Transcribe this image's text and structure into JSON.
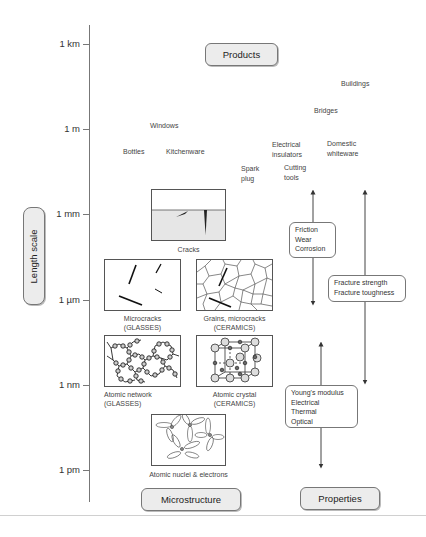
{
  "axis": {
    "title": "Length scale",
    "ticks": [
      {
        "label": "1 km",
        "y": 44
      },
      {
        "label": "1 m",
        "y": 129
      },
      {
        "label": "1 mm",
        "y": 214
      },
      {
        "label": "1 µm",
        "y": 300
      },
      {
        "label": "1 nm",
        "y": 385
      },
      {
        "label": "1 pm",
        "y": 470
      }
    ]
  },
  "headers": {
    "products": "Products",
    "microstructure": "Microstructure",
    "properties": "Properties"
  },
  "products": [
    {
      "label": "Buildings",
      "x": 341,
      "y": 80
    },
    {
      "label": "Bridges",
      "x": 314,
      "y": 107
    },
    {
      "label": "Windows",
      "x": 150,
      "y": 122
    },
    {
      "label": "Electrical",
      "x": 272,
      "y": 141
    },
    {
      "label": "insulators",
      "x": 272,
      "y": 151
    },
    {
      "label": "Domestic",
      "x": 327,
      "y": 140
    },
    {
      "label": "whiteware",
      "x": 327,
      "y": 150
    },
    {
      "label": "Bottles",
      "x": 123,
      "y": 148
    },
    {
      "label": "Kitchenware",
      "x": 166,
      "y": 148
    },
    {
      "label": "Spark",
      "x": 241,
      "y": 165
    },
    {
      "label": "plug",
      "x": 241,
      "y": 175
    },
    {
      "label": "Cutting",
      "x": 284,
      "y": 164
    },
    {
      "label": "tools",
      "x": 284,
      "y": 174
    }
  ],
  "microstructure": {
    "cracks": {
      "caption": "Cracks"
    },
    "microcracks": {
      "caption_line1": "Microcracks",
      "caption_line2": "(GLASSES)"
    },
    "grains": {
      "caption_line1": "Grains, microcracks",
      "caption_line2": "(CERAMICS)"
    },
    "atomic_network": {
      "caption_line1": "Atomic network",
      "caption_line2": "(GLASSES)"
    },
    "atomic_crystal": {
      "caption_line1": "Atomic crystal",
      "caption_line2": "(CERAMICS)"
    },
    "nuclei": {
      "caption": "Atomic nuclei & electrons"
    }
  },
  "properties": {
    "group1": [
      "Friction",
      "Wear",
      "Corrosion"
    ],
    "group2": [
      "Fracture strength",
      "Fracture toughness"
    ],
    "group3": [
      "Young's modulus",
      "Electrical",
      "Thermal",
      "Optical"
    ]
  }
}
